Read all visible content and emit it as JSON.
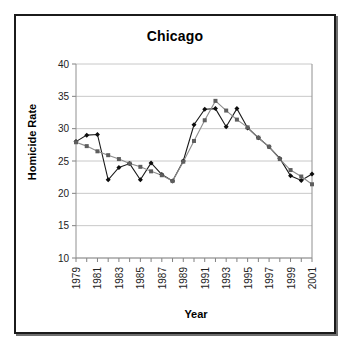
{
  "figure": {
    "title": "Chicago",
    "xlabel": "Year",
    "ylabel": "Homicide Rate"
  },
  "chart_data": {
    "type": "line",
    "title": "Chicago",
    "xlabel": "Year",
    "ylabel": "Homicide Rate",
    "xlim": [
      1979,
      2001
    ],
    "ylim": [
      10,
      40
    ],
    "ytick_values": [
      10,
      15,
      20,
      25,
      30,
      35,
      40
    ],
    "ytick_labels": [
      "10",
      "15",
      "20",
      "25",
      "30",
      "35",
      "40"
    ],
    "grid": "horizontal",
    "legend": "none",
    "x": [
      1979,
      1980,
      1981,
      1982,
      1983,
      1984,
      1985,
      1986,
      1987,
      1988,
      1989,
      1990,
      1991,
      1992,
      1993,
      1994,
      1995,
      1996,
      1997,
      1998,
      1999,
      2000,
      2001
    ],
    "xtick_labels": [
      "1979",
      "",
      "1981",
      "",
      "1983",
      "",
      "1985",
      "",
      "1987",
      "",
      "1989",
      "",
      "1991",
      "",
      "1993",
      "",
      "1995",
      "",
      "1997",
      "",
      "1999",
      "",
      "2001"
    ],
    "series": [
      {
        "name": "series-black-diamond",
        "color": "#0d0d0d",
        "marker": "diamond",
        "values": [
          28.0,
          29.0,
          29.1,
          22.1,
          24.0,
          24.6,
          22.1,
          24.7,
          22.9,
          21.9,
          25.0,
          30.6,
          33.0,
          33.1,
          30.3,
          33.1,
          30.1,
          28.6,
          27.2,
          25.4,
          22.7,
          22.0,
          23.0
        ]
      },
      {
        "name": "series-gray-square",
        "color": "#5e5e5e",
        "marker": "square",
        "values": [
          27.9,
          27.3,
          26.5,
          25.9,
          25.3,
          24.6,
          24.1,
          23.4,
          22.8,
          21.9,
          24.9,
          28.1,
          31.3,
          34.3,
          32.8,
          31.4,
          30.2,
          28.6,
          27.2,
          25.3,
          23.6,
          22.6,
          21.4
        ]
      }
    ]
  }
}
